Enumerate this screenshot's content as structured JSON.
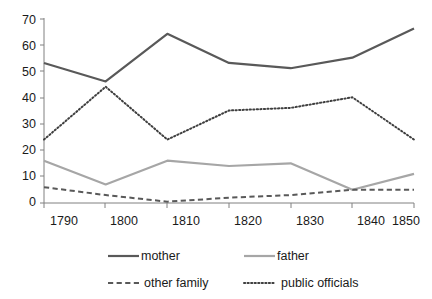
{
  "chart_data": {
    "type": "line",
    "title": "",
    "xlabel": "",
    "ylabel": "",
    "x": [
      1790,
      1800,
      1810,
      1820,
      1830,
      1840,
      1850
    ],
    "categories": [
      "1790",
      "1800",
      "1810",
      "1820",
      "1830",
      "1840",
      "1850"
    ],
    "xlim": [
      1790,
      1850
    ],
    "ylim": [
      0,
      70
    ],
    "y_ticks": [
      0,
      10,
      20,
      30,
      40,
      50,
      60,
      70
    ],
    "y_tick_labels": [
      "0",
      "10",
      "20",
      "30",
      "40",
      "50",
      "60",
      "70"
    ],
    "grid": false,
    "legend_position": "bottom",
    "series": [
      {
        "name": "mother",
        "values": [
          53,
          46,
          64,
          53,
          51,
          55,
          66
        ],
        "color": "#595959",
        "style": "solid",
        "width": 2.2
      },
      {
        "name": "father",
        "values": [
          16,
          7,
          16,
          14,
          15,
          5,
          11
        ],
        "color": "#a6a6a6",
        "style": "solid",
        "width": 2.2
      },
      {
        "name": "other family",
        "values": [
          6,
          3,
          0.5,
          2,
          3,
          5,
          5
        ],
        "color": "#595959",
        "style": "dashed",
        "width": 2.0
      },
      {
        "name": "public officials",
        "values": [
          24,
          44,
          24,
          35,
          36,
          40,
          24
        ],
        "color": "#3f3f3f",
        "style": "dotted",
        "width": 2.0
      }
    ]
  },
  "axes": {
    "y_labels": [
      "70",
      "60",
      "50",
      "40",
      "30",
      "20",
      "10",
      "0"
    ],
    "x_labels": [
      "1790",
      "1800",
      "1810",
      "1820",
      "1830",
      "1840",
      "1850"
    ]
  },
  "legend": {
    "entries": [
      {
        "label": "mother",
        "style": "solid",
        "color": "#595959"
      },
      {
        "label": "father",
        "style": "solid",
        "color": "#a6a6a6"
      },
      {
        "label": "other family",
        "style": "dashed",
        "color": "#595959"
      },
      {
        "label": "public officials",
        "style": "dotted",
        "color": "#3f3f3f"
      }
    ]
  }
}
